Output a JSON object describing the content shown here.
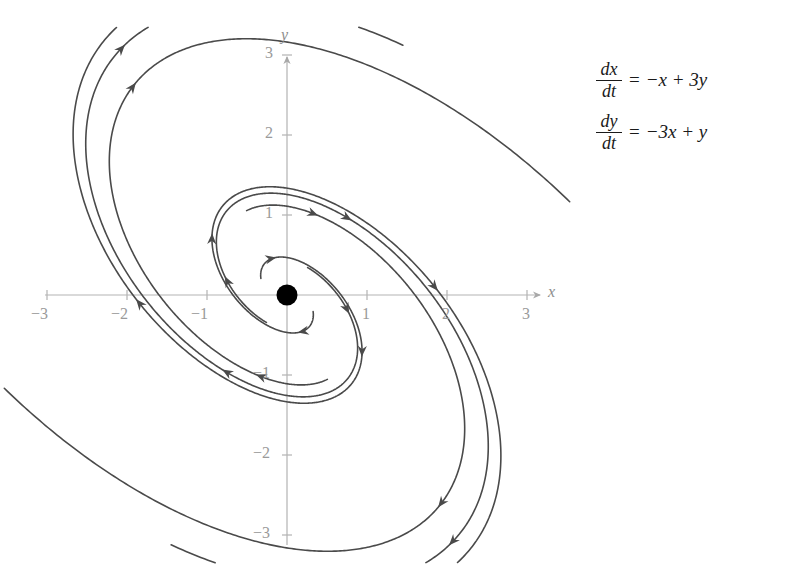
{
  "figure": {
    "title": "",
    "background_color": "#ffffff",
    "curve_color": "#4a4a4a",
    "axis_color": "#b3b3b3",
    "tick_label_color": "#9a9a9a",
    "equilibrium_color": "#000000"
  },
  "equations": [
    {
      "id": "dx-dt",
      "numerator": "dx",
      "denominator": "dt",
      "equals": "=",
      "rhs": "−x + 3y"
    },
    {
      "id": "dy-dt",
      "numerator": "dy",
      "denominator": "dt",
      "equals": "=",
      "rhs": "−3x + y"
    }
  ],
  "axes": {
    "x_label": "x",
    "y_label": "y",
    "x_ticks": [
      {
        "value": -3,
        "label": "−3"
      },
      {
        "value": -2,
        "label": "−2"
      },
      {
        "value": -1,
        "label": "−1"
      },
      {
        "value": 1,
        "label": "1"
      },
      {
        "value": 2,
        "label": "2"
      },
      {
        "value": 3,
        "label": "3"
      }
    ],
    "y_ticks": [
      {
        "value": 3,
        "label": "3"
      },
      {
        "value": 2,
        "label": "2"
      },
      {
        "value": 1,
        "label": "1"
      },
      {
        "value": -1,
        "label": "−1"
      },
      {
        "value": -2,
        "label": "−2"
      },
      {
        "value": -3,
        "label": "−3"
      }
    ]
  },
  "chart_data": {
    "type": "line",
    "title": "",
    "xlabel": "x",
    "ylabel": "y",
    "xlim": [
      -3.4,
      3.4
    ],
    "ylim": [
      -3.1,
      3.1
    ],
    "grid": false,
    "legend": "none",
    "plot_kind": "phase-portrait",
    "system": {
      "dx_dt": "-x + 3y",
      "dy_dt": "-3x + y",
      "matrix": [
        [
          -1,
          3
        ],
        [
          -3,
          1
        ]
      ],
      "eigenvalues": [
        "1 + 3i",
        "1 - 3i"
      ],
      "equilibrium": {
        "x": 0,
        "y": 0,
        "type": "unstable spiral source"
      },
      "rotation": "clockwise",
      "growth_rate": 1.0,
      "angular_rate": 3.0,
      "tilt_degrees": -45
    },
    "pixel_mapping": {
      "origin_px": [
        287,
        295
      ],
      "x_unit_px": 80,
      "y_unit_px": 80
    },
    "trajectories": [
      {
        "name": "spiral-1",
        "r0": 0.3,
        "theta0_deg": 20,
        "t_end": 2.4,
        "arrow_ts": [
          0.35,
          1.1,
          1.85
        ]
      },
      {
        "name": "spiral-2",
        "r0": 0.3,
        "theta0_deg": 200,
        "t_end": 2.4,
        "arrow_ts": [
          0.35,
          1.1,
          1.85
        ]
      },
      {
        "name": "spiral-3",
        "r0": 0.52,
        "theta0_deg": 95,
        "t_end": 2.05,
        "arrow_ts": [
          0.3,
          1.05,
          1.7
        ]
      },
      {
        "name": "spiral-4",
        "r0": 0.52,
        "theta0_deg": 275,
        "t_end": 2.05,
        "arrow_ts": [
          0.3,
          1.05,
          1.7
        ]
      },
      {
        "name": "spiral-5",
        "r0": 0.95,
        "theta0_deg": 150,
        "t_end": 1.75,
        "arrow_ts": [
          0.25,
          0.95,
          1.5
        ]
      },
      {
        "name": "spiral-6",
        "r0": 0.95,
        "theta0_deg": 330,
        "t_end": 1.75,
        "arrow_ts": [
          0.25,
          0.95,
          1.5
        ]
      }
    ],
    "axis_ticks_x": [
      -3,
      -2,
      -1,
      1,
      2,
      3
    ],
    "axis_ticks_y": [
      -3,
      -2,
      -1,
      1,
      2,
      3
    ]
  }
}
